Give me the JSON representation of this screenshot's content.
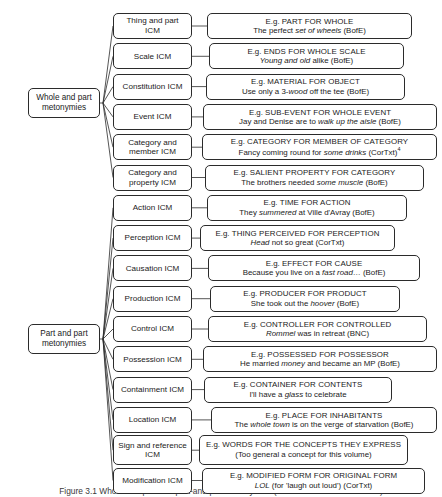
{
  "figure": {
    "caption": "Figure 3.1  Whole-and-part and part-and-part metonymies (after Radden and Kövecses)",
    "width": 442,
    "height": 497,
    "line_color": "#2b2b2b",
    "box_fill": "#ffffff"
  },
  "roots": [
    {
      "id": "whole-and-part",
      "line1": "Whole and part",
      "line2": "metonymies"
    },
    {
      "id": "part-and-part",
      "line1": "Part and part",
      "line2": "metonymies"
    }
  ],
  "branches": [
    {
      "group": "whole-and-part",
      "icm_line1": "Thing and part",
      "icm_line2": "ICM",
      "eg_prefix": "E.g. ",
      "eg_relation": "PART FOR WHOLE",
      "sample_pre": "The perfect ",
      "sample_italic": "set of wheels",
      "sample_post": " (BofE)",
      "sample_sup": ""
    },
    {
      "group": "whole-and-part",
      "icm_line1": "Scale ICM",
      "icm_line2": "",
      "eg_prefix": "E.g. ",
      "eg_relation": "ENDS FOR WHOLE SCALE",
      "sample_pre": "",
      "sample_italic": "Young and old",
      "sample_post": " alike (BofE)",
      "sample_sup": ""
    },
    {
      "group": "whole-and-part",
      "icm_line1": "Constitution ICM",
      "icm_line2": "",
      "eg_prefix": "E.g. ",
      "eg_relation": "MATERIAL FOR OBJECT",
      "sample_pre": "Use only a 3-",
      "sample_italic": "wood",
      "sample_post": " off the tee (BofE)",
      "sample_sup": ""
    },
    {
      "group": "whole-and-part",
      "icm_line1": "Event ICM",
      "icm_line2": "",
      "eg_prefix": "E.g. ",
      "eg_relation": "SUB-EVENT FOR WHOLE EVENT",
      "sample_pre": "Jay and Denise are to ",
      "sample_italic": "walk up the aisle",
      "sample_post": " (BofE)",
      "sample_sup": ""
    },
    {
      "group": "whole-and-part",
      "icm_line1": "Category and",
      "icm_line2": "member ICM",
      "eg_prefix": "E.g. ",
      "eg_relation": "CATEGORY FOR MEMBER OF CATEGORY",
      "sample_pre": "Fancy coming round for ",
      "sample_italic": "some drinks",
      "sample_post": " (CorTxt)",
      "sample_sup": "4"
    },
    {
      "group": "whole-and-part",
      "icm_line1": "Category and",
      "icm_line2": "property ICM",
      "eg_prefix": "E.g. ",
      "eg_relation": "SALIENT PROPERTY FOR CATEGORY",
      "sample_pre": "The brothers needed ",
      "sample_italic": "some muscle",
      "sample_post": " (BofE)",
      "sample_sup": ""
    },
    {
      "group": "part-and-part",
      "icm_line1": "Action ICM",
      "icm_line2": "",
      "eg_prefix": "E.g. ",
      "eg_relation": "TIME FOR ACTION",
      "sample_pre": "They ",
      "sample_italic": "summered",
      "sample_post": " at Ville d'Avray (BofE)",
      "sample_sup": ""
    },
    {
      "group": "part-and-part",
      "icm_line1": "Perception ICM",
      "icm_line2": "",
      "eg_prefix": "E.g. ",
      "eg_relation": "THING PERCEIVED FOR PERCEPTION",
      "sample_pre": "",
      "sample_italic": "Head",
      "sample_post": " not so great (CorTxt)",
      "sample_sup": ""
    },
    {
      "group": "part-and-part",
      "icm_line1": "Causation ICM",
      "icm_line2": "",
      "eg_prefix": "E.g. ",
      "eg_relation": "EFFECT FOR CAUSE",
      "sample_pre": "Because you live on a ",
      "sample_italic": "fast road",
      "sample_post": "… (BofE)",
      "sample_sup": ""
    },
    {
      "group": "part-and-part",
      "icm_line1": "Production ICM",
      "icm_line2": "",
      "eg_prefix": "E.g.  ",
      "eg_relation": "PRODUCER FOR PRODUCT",
      "sample_pre": "She took out the ",
      "sample_italic": "hoover",
      "sample_post": " (BofE)",
      "sample_sup": ""
    },
    {
      "group": "part-and-part",
      "icm_line1": "Control ICM",
      "icm_line2": "",
      "eg_prefix": "E.g. ",
      "eg_relation": "CONTROLLER FOR CONTROLLED",
      "sample_pre": "",
      "sample_italic": "Rommel",
      "sample_post": " was in retreat (BNC)",
      "sample_sup": ""
    },
    {
      "group": "part-and-part",
      "icm_line1": "Possession ICM",
      "icm_line2": "",
      "eg_prefix": "E.g. ",
      "eg_relation": "POSSESSED FOR POSSESSOR",
      "sample_pre": "He married ",
      "sample_italic": "money",
      "sample_post": " and became an MP (BofE)",
      "sample_sup": ""
    },
    {
      "group": "part-and-part",
      "icm_line1": "Containment ICM",
      "icm_line2": "",
      "eg_prefix": "E.g. ",
      "eg_relation": "CONTAINER FOR CONTENTS",
      "sample_pre": "I'll have a ",
      "sample_italic": "glass",
      "sample_post": " to celebrate",
      "sample_sup": ""
    },
    {
      "group": "part-and-part",
      "icm_line1": "Location ICM",
      "icm_line2": "",
      "eg_prefix": "E.g. ",
      "eg_relation": "PLACE FOR INHABITANTS",
      "sample_pre": "The ",
      "sample_italic": "whole town",
      "sample_post": " is on the verge of starvation (BofE)",
      "sample_sup": ""
    },
    {
      "group": "part-and-part",
      "icm_line1": "Sign and reference",
      "icm_line2": "ICM",
      "eg_prefix": "E.g. ",
      "eg_relation": "WORDS FOR THE CONCEPTS THEY EXPRESS",
      "sample_pre": "(Too general a concept for this volume)",
      "sample_italic": "",
      "sample_post": "",
      "sample_sup": ""
    },
    {
      "group": "part-and-part",
      "icm_line1": "Modification ICM",
      "icm_line2": "",
      "eg_prefix": "E.g. ",
      "eg_relation": "MODIFIED FORM FOR ORIGINAL FORM",
      "sample_pre": "",
      "sample_italic": "LOL",
      "sample_post": " (for 'laugh out loud') (CorTxt)",
      "sample_sup": ""
    }
  ]
}
